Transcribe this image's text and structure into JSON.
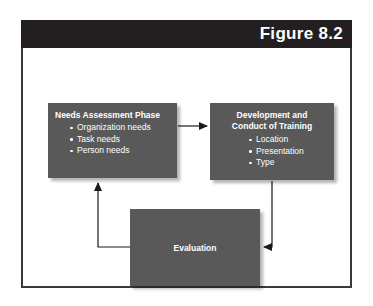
{
  "figure": {
    "label": "Figure 8.2"
  },
  "diagram": {
    "type": "cycle-flow",
    "boxes": [
      {
        "id": "needs-assessment",
        "title": "Needs Assessment Phase",
        "bullets": [
          "Organization needs",
          "Task needs",
          "Person needs"
        ]
      },
      {
        "id": "development-training",
        "title_line1": "Development and",
        "title_line2": "Conduct of Training",
        "bullets": [
          "Location",
          "Presentation",
          "Type"
        ]
      },
      {
        "id": "evaluation",
        "title": "Evaluation"
      }
    ],
    "arrows": [
      {
        "from": "needs-assessment",
        "to": "development-training",
        "direction": "right"
      },
      {
        "from": "development-training",
        "to": "evaluation",
        "direction": "down-left"
      },
      {
        "from": "evaluation",
        "to": "needs-assessment",
        "direction": "left-up"
      }
    ]
  },
  "colors": {
    "box_fill": "#595959",
    "header_band": "#231f20",
    "frame_border": "#3a3a3a",
    "text": "#ffffff",
    "connector": "#1a1a1a",
    "page_background": "#ffffff"
  }
}
